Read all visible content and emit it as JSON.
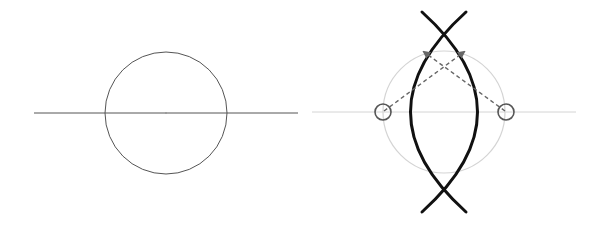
{
  "diagram": {
    "type": "geometric construction",
    "panels": [
      {
        "id": "left",
        "description": "Circle bisected by horizontal line",
        "elements": {
          "baseline": {
            "x1": 34,
            "y1": 113,
            "x2": 298,
            "y2": 113,
            "color": "#555555"
          },
          "circle": {
            "cx": 166,
            "cy": 113,
            "r": 61,
            "color": "#555555"
          }
        }
      },
      {
        "id": "right",
        "description": "Vesica / lens shape formed by two arcs, with guide circle, endpoint handles and dashed arrows",
        "elements": {
          "baseline": {
            "x1": 312,
            "y1": 112,
            "x2": 576,
            "y2": 112,
            "color": "#d0d0d0"
          },
          "guide_circle": {
            "cx": 444,
            "cy": 112,
            "r": 61,
            "color": "#d0d0d0"
          },
          "arcs": {
            "color": "#111111",
            "width": 3
          },
          "handles": [
            {
              "cx": 383,
              "cy": 112,
              "r": 8,
              "color": "#555555"
            },
            {
              "cx": 506,
              "cy": 112,
              "r": 8,
              "color": "#555555"
            }
          ],
          "arrows": {
            "color": "#666666",
            "style": "dashed"
          }
        }
      }
    ]
  }
}
